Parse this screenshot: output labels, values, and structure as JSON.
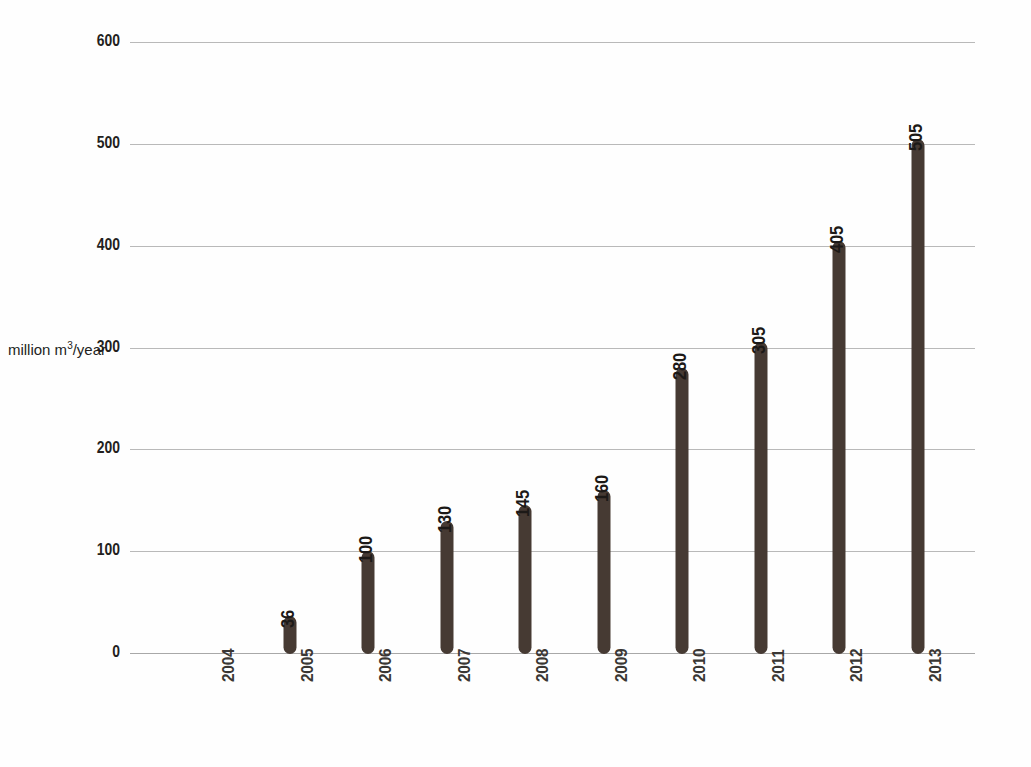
{
  "chart_data": {
    "type": "bar",
    "title": "",
    "subtitle": "",
    "xlabel": "",
    "ylabel": "million m³/year",
    "ylabel_parts": {
      "prefix": "million m",
      "sup": "3",
      "suffix": "/year"
    },
    "categories": [
      "2004",
      "2005",
      "2006",
      "2007",
      "2008",
      "2009",
      "2010",
      "2011",
      "2012",
      "2013"
    ],
    "values": [
      null,
      36,
      100,
      130,
      145,
      160,
      280,
      305,
      405,
      505
    ],
    "value_labels": [
      "",
      "36",
      "100",
      "130",
      "145",
      "160",
      "280",
      "305",
      "405",
      "505"
    ],
    "ylim": [
      0,
      600
    ],
    "yticks": [
      0,
      100,
      200,
      300,
      400,
      500,
      600
    ],
    "ytick_labels": [
      "0",
      "100",
      "200",
      "300",
      "400",
      "500",
      "600"
    ],
    "grid": true,
    "grid_axis": "y",
    "legend": null,
    "legend_position": "none",
    "bar_color": "#463a33",
    "grid_color": "#b9b9b9",
    "text_color": "#231f1d",
    "background_color": "#ffffff"
  }
}
